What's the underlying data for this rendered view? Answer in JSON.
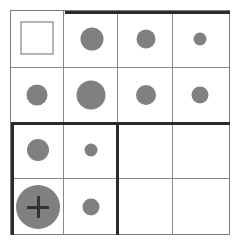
{
  "figure": {
    "type": "diagram-grid",
    "canvas": {
      "width": 240,
      "height": 245
    },
    "background_color": "#ffffff"
  },
  "grid": {
    "rows": 4,
    "columns": 4,
    "bounds": {
      "left": 10,
      "top": 10,
      "width": 220,
      "height": 225
    },
    "thin_line_color": "#8a8a8a",
    "thin_line_width": 1,
    "thick_line_color": "#2b2b2b",
    "thick_line_width": 3,
    "column_dividers_x": [
      63,
      117,
      172
    ],
    "row_dividers_y": [
      67,
      123,
      178
    ]
  },
  "marks": {
    "circle_color": "#808080",
    "square_border_color": "#6e6e6e",
    "plus_color": "#333333",
    "cells": [
      {
        "id": "r1c1",
        "row": 1,
        "column": 1,
        "shape": "square-outline",
        "size": 33,
        "center_x": 37,
        "center_y": 38,
        "label": "empty square outline"
      },
      {
        "id": "r1c2",
        "row": 1,
        "column": 2,
        "shape": "circle",
        "size": 23,
        "center_x": 92,
        "center_y": 39,
        "label": "medium gray circle"
      },
      {
        "id": "r1c3",
        "row": 1,
        "column": 3,
        "shape": "circle",
        "size": 19,
        "center_x": 146,
        "center_y": 39,
        "label": "small-medium gray circle"
      },
      {
        "id": "r1c4",
        "row": 1,
        "column": 4,
        "shape": "circle",
        "size": 13,
        "center_x": 200,
        "center_y": 39,
        "label": "small gray circle"
      },
      {
        "id": "r2c1",
        "row": 2,
        "column": 1,
        "shape": "circle",
        "size": 21,
        "center_x": 37,
        "center_y": 95,
        "label": "medium gray circle"
      },
      {
        "id": "r2c2",
        "row": 2,
        "column": 2,
        "shape": "circle",
        "size": 29,
        "center_x": 91,
        "center_y": 95,
        "label": "large gray circle"
      },
      {
        "id": "r2c3",
        "row": 2,
        "column": 3,
        "shape": "circle",
        "size": 20,
        "center_x": 146,
        "center_y": 95,
        "label": "medium gray circle"
      },
      {
        "id": "r2c4",
        "row": 2,
        "column": 4,
        "shape": "circle",
        "size": 17,
        "center_x": 200,
        "center_y": 95,
        "label": "small-medium gray circle"
      },
      {
        "id": "r3c1",
        "row": 3,
        "column": 1,
        "shape": "circle",
        "size": 22,
        "center_x": 38,
        "center_y": 150,
        "label": "medium gray circle"
      },
      {
        "id": "r3c2",
        "row": 3,
        "column": 2,
        "shape": "circle",
        "size": 13,
        "center_x": 91,
        "center_y": 150,
        "label": "small gray circle"
      },
      {
        "id": "r3c3",
        "row": 3,
        "column": 3,
        "shape": "none",
        "label": "empty cell"
      },
      {
        "id": "r3c4",
        "row": 3,
        "column": 4,
        "shape": "none",
        "label": "empty cell"
      },
      {
        "id": "r4c1",
        "row": 4,
        "column": 1,
        "shape": "circle-with-plus",
        "size": 44,
        "plus_size": 22,
        "center_x": 38,
        "center_y": 207,
        "label": "large gray circle with plus crosshair"
      },
      {
        "id": "r4c2",
        "row": 4,
        "column": 2,
        "shape": "circle",
        "size": 17,
        "center_x": 91,
        "center_y": 207,
        "label": "small gray circle"
      },
      {
        "id": "r4c3",
        "row": 4,
        "column": 3,
        "shape": "none",
        "label": "empty cell"
      },
      {
        "id": "r4c4",
        "row": 4,
        "column": 4,
        "shape": "none",
        "label": "empty cell"
      }
    ]
  },
  "emphasis_strokes": [
    {
      "id": "stroke-top-cols-2-4",
      "orientation": "horizontal",
      "left": 65,
      "top": 11,
      "length": 165,
      "label": "thick rule above columns 2 to 4 of row 1"
    },
    {
      "id": "stroke-mid-full-width",
      "orientation": "horizontal",
      "left": 11,
      "top": 122,
      "length": 219,
      "label": "thick rule across full width below row 2"
    },
    {
      "id": "stroke-left-rows-3-4",
      "orientation": "vertical",
      "left": 11,
      "top": 122,
      "length": 113,
      "label": "thick rule on left edge of rows 3 and 4"
    },
    {
      "id": "stroke-col2-rows-3-4",
      "orientation": "vertical",
      "left": 116,
      "top": 122,
      "length": 113,
      "label": "thick rule right of column 2 in rows 3 and 4"
    }
  ]
}
